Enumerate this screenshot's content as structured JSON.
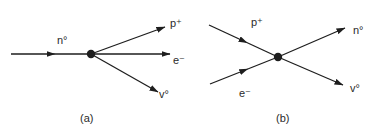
{
  "panels": [
    {
      "id": "a",
      "caption": "(a)",
      "vertex": {
        "x": 91,
        "y": 54
      },
      "particles": [
        {
          "name": "n0",
          "label": "n°",
          "direction": "in",
          "from": [
            11,
            54
          ],
          "to": [
            91,
            54
          ],
          "label_pos": [
            57,
            44
          ]
        },
        {
          "name": "p+",
          "label": "p⁺",
          "direction": "out",
          "from": [
            91,
            54
          ],
          "to": [
            165,
            27
          ],
          "label_pos": [
            170,
            27
          ]
        },
        {
          "name": "e-",
          "label": "e⁻",
          "direction": "out",
          "from": [
            91,
            54
          ],
          "to": [
            170,
            54
          ],
          "label_pos": [
            173,
            64
          ]
        },
        {
          "name": "v0",
          "label": "v°",
          "direction": "out",
          "from": [
            91,
            54
          ],
          "to": [
            158,
            92
          ],
          "label_pos": [
            159,
            98
          ]
        }
      ],
      "caption_pos": [
        80,
        122
      ]
    },
    {
      "id": "b",
      "caption": "(b)",
      "vertex": {
        "x": 278,
        "y": 57
      },
      "particles": [
        {
          "name": "p+",
          "label": "p⁺",
          "direction": "in",
          "from": [
            209,
            25
          ],
          "to": [
            278,
            57
          ],
          "label_pos": [
            251,
            26
          ]
        },
        {
          "name": "e-",
          "label": "e⁻",
          "direction": "in",
          "from": [
            210,
            84
          ],
          "to": [
            278,
            57
          ],
          "label_pos": [
            239,
            97
          ]
        },
        {
          "name": "n0",
          "label": "n°",
          "direction": "out",
          "from": [
            278,
            57
          ],
          "to": [
            345,
            28
          ],
          "label_pos": [
            353,
            34
          ]
        },
        {
          "name": "v0",
          "label": "v°",
          "direction": "out",
          "from": [
            278,
            57
          ],
          "to": [
            343,
            85
          ],
          "label_pos": [
            350,
            92
          ]
        }
      ],
      "caption_pos": [
        276,
        122
      ]
    }
  ],
  "colors": {
    "ink": "#1e1e1e",
    "background": "#ffffff"
  }
}
